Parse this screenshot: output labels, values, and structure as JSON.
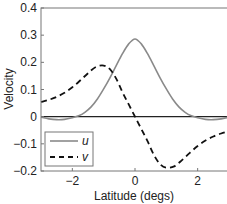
{
  "chart_data": {
    "type": "line",
    "title": "",
    "xlabel": "Latitude (degs)",
    "ylabel": "Velocity",
    "xlim": [
      -3,
      3
    ],
    "ylim": [
      -0.2,
      0.4
    ],
    "xticks": [
      -2,
      0,
      2
    ],
    "xtick_labels": [
      "−2",
      "0",
      "2"
    ],
    "yticks": [
      -0.2,
      -0.1,
      0,
      0.1,
      0.2,
      0.3,
      0.4
    ],
    "ytick_labels": [
      "−0.2",
      "−0.1",
      "0",
      "0.1",
      "0.2",
      "0.3",
      "0.4"
    ],
    "grid": false,
    "legend_position": "lower left",
    "zero_line": true,
    "series": [
      {
        "name": "u",
        "style": "solid",
        "color": "#8a8a8a",
        "x": [
          -3.0,
          -2.75,
          -2.5,
          -2.25,
          -2.0,
          -1.8,
          -1.6,
          -1.4,
          -1.2,
          -1.0,
          -0.8,
          -0.6,
          -0.4,
          -0.2,
          0.0,
          0.2,
          0.4,
          0.6,
          0.8,
          1.0,
          1.2,
          1.4,
          1.6,
          1.8,
          2.0,
          2.25,
          2.5,
          2.75,
          3.0
        ],
        "values": [
          -0.002,
          -0.008,
          -0.011,
          -0.01,
          -0.004,
          0.003,
          0.016,
          0.036,
          0.065,
          0.102,
          0.143,
          0.188,
          0.232,
          0.268,
          0.286,
          0.268,
          0.232,
          0.188,
          0.143,
          0.102,
          0.065,
          0.036,
          0.016,
          0.003,
          -0.004,
          -0.01,
          -0.011,
          -0.008,
          -0.002
        ]
      },
      {
        "name": "v",
        "style": "dashed",
        "color": "#111111",
        "x": [
          -3.0,
          -2.75,
          -2.5,
          -2.25,
          -2.0,
          -1.75,
          -1.5,
          -1.25,
          -1.0,
          -0.8,
          -0.6,
          -0.4,
          -0.2,
          0.0,
          0.2,
          0.4,
          0.6,
          0.8,
          1.0,
          1.25,
          1.5,
          1.75,
          2.0,
          2.25,
          2.5,
          2.75,
          3.0
        ],
        "values": [
          0.054,
          0.062,
          0.073,
          0.088,
          0.108,
          0.133,
          0.16,
          0.183,
          0.188,
          0.175,
          0.14,
          0.09,
          0.045,
          0.0,
          -0.045,
          -0.09,
          -0.14,
          -0.175,
          -0.188,
          -0.183,
          -0.16,
          -0.133,
          -0.108,
          -0.088,
          -0.073,
          -0.062,
          -0.054
        ]
      }
    ]
  },
  "legend": {
    "items": [
      {
        "label": "u",
        "style": "solid"
      },
      {
        "label": "v",
        "style": "dashed"
      }
    ]
  }
}
